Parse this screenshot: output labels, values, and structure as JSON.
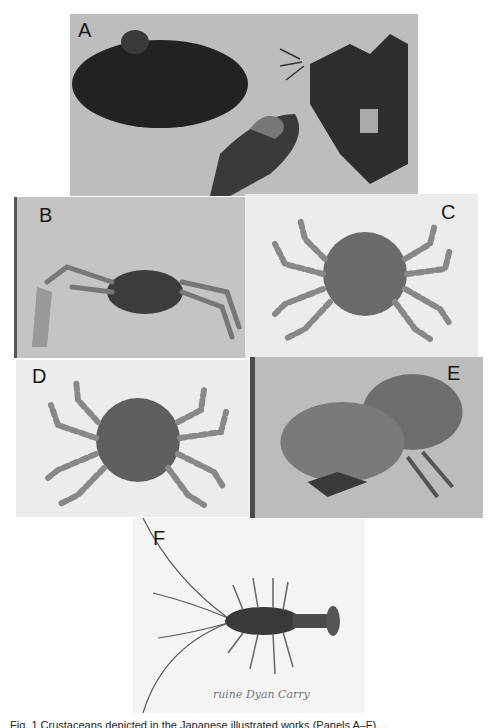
{
  "figure": {
    "panels": [
      {
        "id": "A",
        "label": "A",
        "description": "photograph of specimens (mussel-like shells, hairy crab on rock)"
      },
      {
        "id": "B",
        "label": "B",
        "description": "photograph of crab with long chela"
      },
      {
        "id": "C",
        "label": "C",
        "description": "illustration of round crab with banded legs"
      },
      {
        "id": "D",
        "label": "D",
        "description": "illustration of round crab with banded legs"
      },
      {
        "id": "E",
        "label": "E",
        "description": "photograph of two crabs"
      },
      {
        "id": "F",
        "label": "F",
        "description": "illustration of spiny lobster with long antennae",
        "handwriting": "ruine Dyan Carry"
      }
    ],
    "caption": "Fig. 1 Crustaceans depicted in the Japanese illustrated works (Panels A–F) ..."
  },
  "colors": {
    "photo_gray": "#bdbdbd",
    "illustration_bg": "#ececec",
    "dark_specimen": "#2a2a2a"
  }
}
